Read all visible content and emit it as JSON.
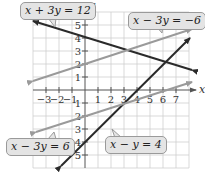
{
  "diagram": {
    "type": "coordinate-plane-linear-system",
    "axes": {
      "x_label": "x",
      "y_label": "y",
      "x_ticks": [
        "-3",
        "-2",
        "-1",
        "1",
        "2",
        "3",
        "4",
        "5",
        "6",
        "7"
      ],
      "y_ticks": [
        "5",
        "4",
        "3",
        "2",
        "1",
        "-1",
        "-2",
        "-3",
        "-4",
        "-5"
      ],
      "x_range": [
        -4,
        8
      ],
      "y_range": [
        -6,
        6
      ]
    },
    "lines": [
      {
        "equation": "x + 3y = 12",
        "color": "#2a2a2a"
      },
      {
        "equation": "x − 3y = −6",
        "color": "#9a9a9a"
      },
      {
        "equation": "x − y = 4",
        "color": "#2a2a2a"
      },
      {
        "equation": "x − 3y = 6",
        "color": "#9a9a9a"
      }
    ],
    "labels": {
      "l1": "x + 3y = 12",
      "l2": "x − 3y = −6",
      "l3": "x − y = 4",
      "l4": "x − 3y = 6"
    },
    "points": [
      {
        "x": 3,
        "y": 3
      },
      {
        "x": 6,
        "y": 2
      },
      {
        "x": 3,
        "y": -1
      }
    ]
  }
}
